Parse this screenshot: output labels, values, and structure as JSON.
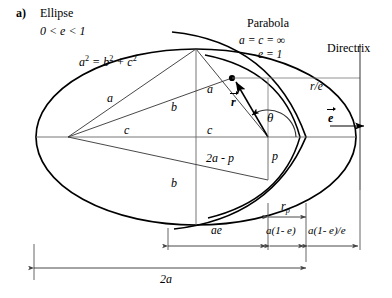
{
  "figure": {
    "panel_label": "a)",
    "conic_title": "Ellipse",
    "eccentricity_condition": "0 < e < 1",
    "relation_base": "a",
    "relation_mid": "= b",
    "relation_tail": "+ c",
    "relation_exp1": "2",
    "relation_exp2": "2",
    "relation_exp3": "2",
    "parabola_title": "Parabola",
    "parabola_line1": "a = c = ∞",
    "parabola_line2": "e = 1",
    "directrix_label": "Directrix",
    "r_over_e_label": "r/e",
    "semi_major_left": "a",
    "semi_major_right": "a",
    "semi_minor_top": "b",
    "semi_minor_bottom": "b",
    "focal_left": "c",
    "focal_right": "c",
    "radius_vector": "r",
    "eccentricity_vector": "e",
    "angle_label": "θ",
    "p_label": "p",
    "two_a_minus_p": "2a - p",
    "dim_ae": "ae",
    "dim_a1me": "a(1- e)",
    "dim_a1me_over_e": "a(1- e)/e",
    "dim_rp_base": "r",
    "dim_rp_sub": "p",
    "dim_2a": "2a",
    "colors": {
      "stroke": "#000000",
      "thin_stroke": "#555555",
      "background": "#ffffff"
    }
  }
}
